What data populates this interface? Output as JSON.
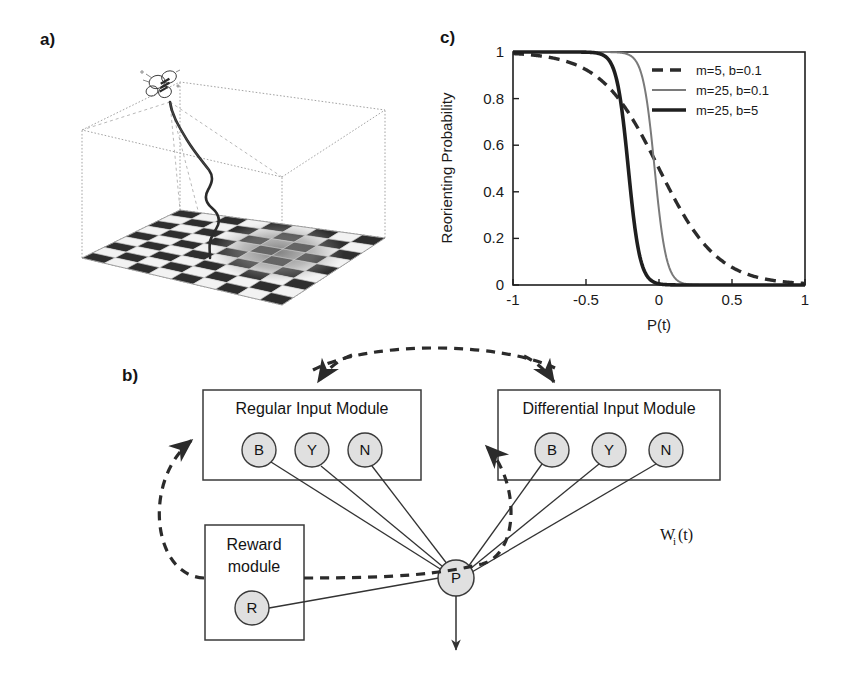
{
  "figure": {
    "panels": [
      {
        "id": "a",
        "label": "a)"
      },
      {
        "id": "b",
        "label": "b)"
      },
      {
        "id": "c",
        "label": "c)"
      }
    ]
  },
  "panel_a": {
    "label": "a)",
    "description": "3D arena box with checkerboard floor and insect flight trajectory",
    "elements": {
      "insect": "bee-icon",
      "trajectory": "flight-path",
      "floor": "checkerboard-floor",
      "arena": "wireframe-box"
    },
    "colors": {
      "wireframe": "#9a9a9a",
      "trajectory": "#2b2b2b",
      "checker_dark": "#2e2e2e",
      "checker_light": "#f2f2f2",
      "blur_patch": "#8f8f8f"
    }
  },
  "panel_b": {
    "label": "b)",
    "boxes": [
      {
        "id": "regular",
        "title": "Regular Input Module",
        "nodes": [
          "B",
          "Y",
          "N"
        ]
      },
      {
        "id": "differential",
        "title": "Differential Input Module",
        "nodes": [
          "B",
          "Y",
          "N"
        ]
      },
      {
        "id": "reward",
        "title_line1": "Reward",
        "title_line2": "module",
        "nodes": [
          "R"
        ]
      }
    ],
    "output_node": "P",
    "weight_label": {
      "base": "W",
      "sub": "i",
      "suffix": "(t)"
    },
    "colors": {
      "node_fill": "#e0e0e0",
      "stroke": "#3a3a3a",
      "dashed": "#2b2b2b"
    }
  },
  "panel_c": {
    "label": "c)"
  },
  "chart_data": {
    "type": "line",
    "title": "",
    "xlabel": "P(t)",
    "ylabel": "Reorienting Probability",
    "xlim": [
      -1,
      1
    ],
    "ylim": [
      0,
      1
    ],
    "xticks": [
      -1,
      -0.5,
      0,
      0.5,
      1
    ],
    "xtick_labels": [
      "-1",
      "-0.5",
      "0",
      "0.5",
      "1"
    ],
    "yticks": [
      0,
      0.2,
      0.4,
      0.6,
      0.8,
      1
    ],
    "ytick_labels": [
      "0",
      "0.2",
      "0.4",
      "0.6",
      "0.8",
      "1"
    ],
    "grid": false,
    "legend_position": "upper right",
    "function": "logistic decreasing: y = 1 / (1 + exp(m*(x + b_shift)))",
    "series": [
      {
        "name": "m=5, b=0.1",
        "style": "dashed",
        "color": "#2b2b2b",
        "width": 3.4,
        "m": 5,
        "b": 0.1,
        "midpoint_x": 0.0,
        "x": [
          -1.0,
          -0.9,
          -0.8,
          -0.7,
          -0.6,
          -0.5,
          -0.4,
          -0.3,
          -0.2,
          -0.1,
          0.0,
          0.1,
          0.2,
          0.3,
          0.4,
          0.5,
          0.6,
          0.7,
          0.8,
          0.9,
          1.0
        ],
        "y": [
          0.993,
          0.989,
          0.982,
          0.97,
          0.953,
          0.924,
          0.881,
          0.818,
          0.731,
          0.622,
          0.5,
          0.378,
          0.269,
          0.182,
          0.119,
          0.076,
          0.047,
          0.03,
          0.018,
          0.011,
          0.007
        ]
      },
      {
        "name": "m=25, b=0.1",
        "style": "thin-solid",
        "color": "#7a7a7a",
        "width": 2.0,
        "m": 25,
        "b": 0.1,
        "midpoint_x": -0.03,
        "x": [
          -1.0,
          -0.5,
          -0.3,
          -0.2,
          -0.15,
          -0.1,
          -0.07,
          -0.05,
          -0.03,
          -0.01,
          0.02,
          0.05,
          0.1,
          0.15,
          0.2,
          0.3,
          0.5,
          1.0
        ],
        "y": [
          1.0,
          1.0,
          0.999,
          0.988,
          0.957,
          0.858,
          0.731,
          0.622,
          0.5,
          0.378,
          0.231,
          0.132,
          0.047,
          0.016,
          0.005,
          0.001,
          0.0,
          0.0
        ]
      },
      {
        "name": "m=25, b=5",
        "style": "thick-solid",
        "color": "#1f1f1f",
        "width": 3.6,
        "m": 25,
        "b": 5,
        "midpoint_x": -0.21,
        "x": [
          -1.0,
          -0.6,
          -0.45,
          -0.38,
          -0.33,
          -0.29,
          -0.26,
          -0.24,
          -0.21,
          -0.19,
          -0.16,
          -0.13,
          -0.09,
          -0.05,
          0.0,
          0.3,
          1.0
        ],
        "y": [
          1.0,
          1.0,
          0.999,
          0.988,
          0.957,
          0.881,
          0.788,
          0.679,
          0.5,
          0.378,
          0.231,
          0.132,
          0.047,
          0.016,
          0.005,
          0.0,
          0.0
        ]
      }
    ]
  }
}
